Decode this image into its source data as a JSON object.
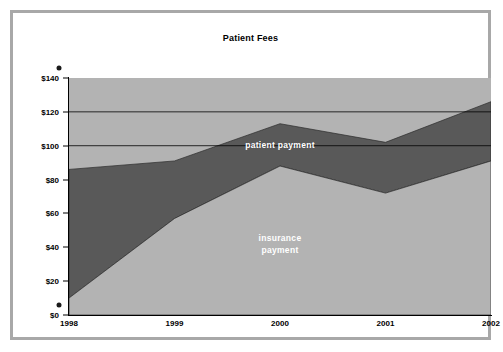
{
  "chart_data": {
    "type": "area",
    "stacked": true,
    "title": "Patient Fees",
    "xlabel": "",
    "ylabel": "",
    "categories": [
      "1998",
      "1999",
      "2000",
      "2001",
      "2002"
    ],
    "ylim": [
      0,
      140
    ],
    "yticks": [
      "$0",
      "$20",
      "$40",
      "$60",
      "$80",
      "$100",
      "$120",
      "$140"
    ],
    "ytick_values": [
      0,
      20,
      40,
      60,
      80,
      100,
      120,
      140
    ],
    "grid": "horizontal gridlines visible at $100 and $120 only",
    "legend": "inline area labels",
    "series": [
      {
        "name": "insurance payment",
        "values": [
          10,
          57,
          88,
          72,
          91
        ],
        "color": "#b3b3b3"
      },
      {
        "name": "patient payment",
        "values": [
          76,
          34,
          25,
          30,
          35
        ],
        "cumulative_totals": [
          86,
          91,
          113,
          102,
          126
        ],
        "color": "#595959"
      }
    ],
    "annotations": [
      {
        "text": "patient payment",
        "series": "patient payment"
      },
      {
        "text": "insurance\npayment",
        "series": "insurance payment"
      }
    ]
  },
  "colors": {
    "insurance_fill": "#b3b3b3",
    "patient_fill": "#595959",
    "frame_border": "#a8a8a8",
    "axis": "#000000",
    "label_text": "#ffffff",
    "background": "#ffffff"
  },
  "labels": {
    "patient_payment": "patient payment",
    "insurance_payment": "insurance\npayment"
  }
}
